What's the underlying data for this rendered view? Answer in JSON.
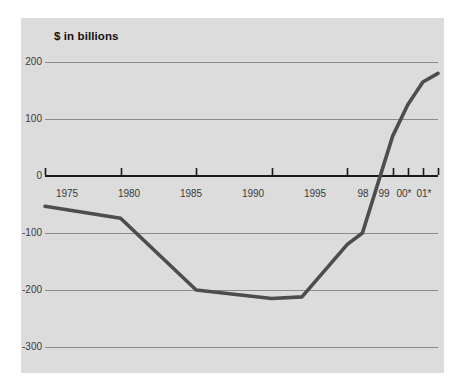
{
  "chart_data": {
    "type": "line",
    "title": "$ in billions",
    "subtitle": "",
    "xlabel": "",
    "ylabel": "$ in billions",
    "grid": true,
    "legend": false,
    "legend_position": "none",
    "xlim": [
      1975,
      2001
    ],
    "ylim": [
      -300,
      200
    ],
    "x_tick_labels": [
      "1975",
      "1980",
      "1985",
      "1990",
      "1995",
      "98",
      "99",
      "00*",
      "01*"
    ],
    "x_tick_values": [
      1975,
      1980,
      1985,
      1990,
      1995,
      1998,
      1999,
      2000,
      2001
    ],
    "y_tick_labels": [
      "200",
      "100",
      "0",
      "-100",
      "-200",
      "-300"
    ],
    "y_tick_values": [
      200,
      100,
      0,
      -100,
      -200,
      -300
    ],
    "series": [
      {
        "name": "Federal budget surplus/deficit",
        "color": "#4d4d4d",
        "x": [
          1975,
          1980,
          1985,
          1990,
          1992,
          1995,
          1996,
          1998,
          1999,
          2000,
          2001
        ],
        "values": [
          -53,
          -74,
          -200,
          -215,
          -212,
          -120,
          -100,
          70,
          125,
          165,
          180
        ]
      }
    ],
    "annotations": [],
    "colors": {
      "panel_background": "#dcdcdc",
      "figure_background": "#ffffff",
      "gridline": "#8c8c8c",
      "axis": "#1a1a1a",
      "line": "#4d4d4d",
      "tick_label": "#3a3a3a",
      "title_text": "#111111"
    }
  }
}
